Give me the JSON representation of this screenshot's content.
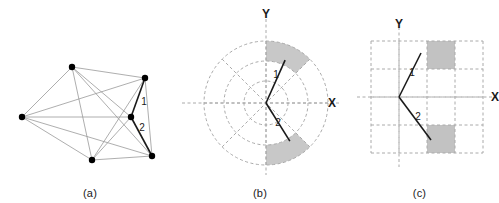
{
  "figure": {
    "width": 499,
    "height": 203,
    "background": "#ffffff"
  },
  "colors": {
    "node_fill": "#000000",
    "edge_light": "#999999",
    "edge_dark": "#1a1a1a",
    "shaded_sector": "#c8c8c8",
    "shaded_cell": "#c2c2c2",
    "grid_dashed": "#aaaaaa",
    "text": "#1a1a1a"
  },
  "panels": [
    {
      "id": "a",
      "caption": "(a)",
      "type": "graph",
      "nodes": [
        {
          "name": "node-top",
          "x": 72,
          "y": 67
        },
        {
          "name": "node-upper-right",
          "x": 145,
          "y": 78
        },
        {
          "name": "node-left",
          "x": 22,
          "y": 117
        },
        {
          "name": "node-center",
          "x": 131,
          "y": 117
        },
        {
          "name": "node-bottom-left",
          "x": 92,
          "y": 160
        },
        {
          "name": "node-bottom-right",
          "x": 152,
          "y": 156
        }
      ],
      "edges": [
        {
          "from": 0,
          "to": 1,
          "highlight": false
        },
        {
          "from": 0,
          "to": 2,
          "highlight": false
        },
        {
          "from": 0,
          "to": 3,
          "highlight": false
        },
        {
          "from": 0,
          "to": 4,
          "highlight": false
        },
        {
          "from": 0,
          "to": 5,
          "highlight": false
        },
        {
          "from": 1,
          "to": 2,
          "highlight": false
        },
        {
          "from": 1,
          "to": 4,
          "highlight": false
        },
        {
          "from": 1,
          "to": 5,
          "highlight": false
        },
        {
          "from": 2,
          "to": 3,
          "highlight": false
        },
        {
          "from": 2,
          "to": 4,
          "highlight": false
        },
        {
          "from": 2,
          "to": 5,
          "highlight": false
        },
        {
          "from": 3,
          "to": 4,
          "highlight": false
        },
        {
          "from": 4,
          "to": 5,
          "highlight": false
        },
        {
          "from": 3,
          "to": 1,
          "highlight": true
        },
        {
          "from": 3,
          "to": 5,
          "highlight": true
        }
      ],
      "edge_labels": [
        {
          "text": "1",
          "x": 144,
          "y": 105
        },
        {
          "text": "2",
          "x": 142,
          "y": 131
        }
      ]
    },
    {
      "id": "b",
      "caption": "(b)",
      "type": "polar",
      "center": {
        "x": 86,
        "y": 103
      },
      "rings": [
        22,
        42,
        62
      ],
      "sector_step_deg": 45,
      "axis_labels": [
        {
          "text": "Y",
          "x": 86,
          "y": 18
        },
        {
          "text": "X",
          "x": 152,
          "y": 107
        }
      ],
      "shaded_sectors": [
        {
          "start_deg": 45,
          "end_deg": 90,
          "r_inner": 42,
          "r_outer": 62
        },
        {
          "start_deg": -90,
          "end_deg": -45,
          "r_inner": 42,
          "r_outer": 62
        }
      ],
      "vectors": [
        {
          "label": "1",
          "angle_deg": 66,
          "length": 47,
          "label_x": 96,
          "label_y": 78
        },
        {
          "label": "2",
          "angle_deg": -58,
          "length": 45,
          "label_x": 98,
          "label_y": 126
        }
      ]
    },
    {
      "id": "c",
      "caption": "(c)",
      "type": "grid",
      "origin": {
        "x": 59,
        "y": 97
      },
      "cell": 28,
      "cols": 4,
      "rows": 4,
      "grid_left": 31,
      "grid_top": 41,
      "axis_labels": [
        {
          "text": "Y",
          "x": 59,
          "y": 28
        },
        {
          "text": "X",
          "x": 155,
          "y": 101
        }
      ],
      "shaded_cells": [
        {
          "col": 2,
          "row": 0
        },
        {
          "col": 2,
          "row": 3
        }
      ],
      "vectors": [
        {
          "label": "1",
          "x1": 59,
          "y1": 97,
          "x2": 81,
          "y2": 53,
          "label_x": 72,
          "label_y": 76
        },
        {
          "label": "2",
          "x1": 59,
          "y1": 97,
          "x2": 91,
          "y2": 140,
          "label_x": 78,
          "label_y": 120
        }
      ]
    }
  ]
}
